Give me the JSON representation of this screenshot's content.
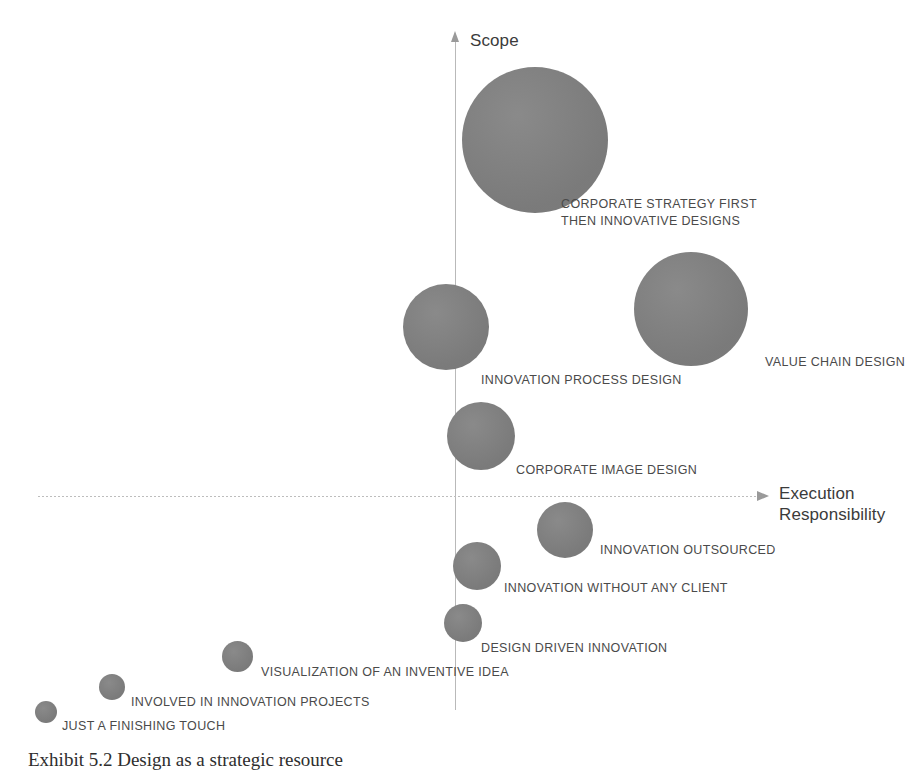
{
  "chart_data": {
    "type": "scatter",
    "title": "",
    "xlabel": "Execution Responsibility",
    "ylabel": "Scope",
    "xlim": [
      -1,
      1
    ],
    "ylim": [
      -1,
      1
    ],
    "grid": false,
    "legend": "none",
    "axes": {
      "y_axis_label": "Scope",
      "x_axis_label_line1": "Execution",
      "x_axis_label_line2": "Responsibility",
      "origin_px": {
        "x": 455,
        "y": 496
      },
      "y_axis_direction": "up",
      "x_axis_direction": "right",
      "axis_color": "#b9b9b9"
    },
    "bubble_fill_color": "#818181",
    "label_color": "#4a4a4a",
    "points": [
      {
        "label": "CORPORATE STRATEGY FIRST\nTHEN INNOVATIVE DESIGNS",
        "cx": 535,
        "cy": 140,
        "diameter": 146,
        "label_x": 561,
        "label_y": 196
      },
      {
        "label": "VALUE CHAIN DESIGN",
        "cx": 691,
        "cy": 309,
        "diameter": 114,
        "label_x": 765,
        "label_y": 354
      },
      {
        "label": "INNOVATION PROCESS DESIGN",
        "cx": 446,
        "cy": 327,
        "diameter": 86,
        "label_x": 481,
        "label_y": 372
      },
      {
        "label": "CORPORATE IMAGE DESIGN",
        "cx": 481,
        "cy": 436,
        "diameter": 68,
        "label_x": 516,
        "label_y": 462
      },
      {
        "label": "INNOVATION OUTSOURCED",
        "cx": 565,
        "cy": 530,
        "diameter": 56,
        "label_x": 600,
        "label_y": 542
      },
      {
        "label": "INNOVATION WITHOUT ANY CLIENT",
        "cx": 477,
        "cy": 566,
        "diameter": 48,
        "label_x": 504,
        "label_y": 580
      },
      {
        "label": "DESIGN DRIVEN INNOVATION",
        "cx": 463,
        "cy": 623,
        "diameter": 38,
        "label_x": 481,
        "label_y": 640
      },
      {
        "label": "VISUALIZATION OF AN INVENTIVE IDEA",
        "cx": 237,
        "cy": 656,
        "diameter": 31,
        "label_x": 261,
        "label_y": 664
      },
      {
        "label": "INVOLVED IN INNOVATION PROJECTS",
        "cx": 112,
        "cy": 687,
        "diameter": 26,
        "label_x": 131,
        "label_y": 694
      },
      {
        "label": "JUST A FINISHING TOUCH",
        "cx": 46,
        "cy": 712,
        "diameter": 22,
        "label_x": 62,
        "label_y": 718
      }
    ]
  },
  "caption": "Exhibit 5.2  Design as a strategic resource"
}
